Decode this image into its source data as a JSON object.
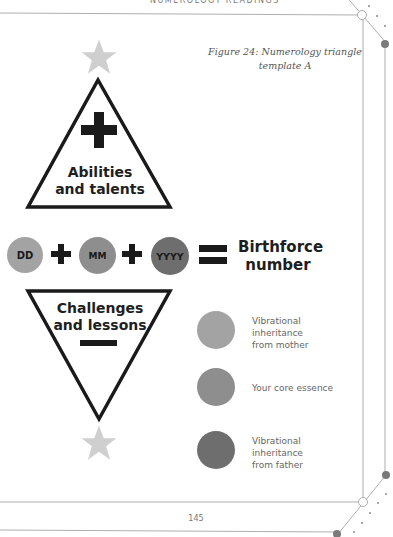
{
  "header": {
    "running_title": "NUMEROLOGY READINGS"
  },
  "figure": {
    "caption_line1": "Figure 24: Numerology triangle",
    "caption_line2": "template A"
  },
  "upper_triangle": {
    "symbol": "plus-icon",
    "label_line1": "Abilities",
    "label_line2": "and talents"
  },
  "equation": {
    "terms": [
      {
        "label": "DD",
        "color": "#a3a3a3"
      },
      {
        "label": "MM",
        "color": "#8e8e8e"
      },
      {
        "label": "YYYY",
        "color": "#6e6e6e"
      }
    ],
    "operator_plus": "+",
    "operator_equals": "=",
    "result_line1": "Birthforce",
    "result_line2": "number"
  },
  "lower_triangle": {
    "symbol": "minus-icon",
    "label_line1": "Challenges",
    "label_line2": "and lessons"
  },
  "legend": [
    {
      "color": "#a3a3a3",
      "lines": [
        "Vibrational",
        "inheritance",
        "from mother"
      ]
    },
    {
      "color": "#8e8e8e",
      "lines": [
        "Your core essence"
      ]
    },
    {
      "color": "#6e6e6e",
      "lines": [
        "Vibrational",
        "inheritance",
        "from father"
      ]
    }
  ],
  "colors": {
    "star": "#cfcfcf",
    "frame_line": "#9a9a9a",
    "accent_dot": "#7a7a7a",
    "triangle_stroke": "#1a1a1a"
  },
  "footer": {
    "page_number": "145"
  }
}
